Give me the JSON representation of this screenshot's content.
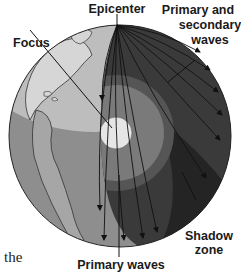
{
  "diagram": {
    "labels": {
      "epicenter": "Epicenter",
      "focus": "Focus",
      "primary_secondary_line1": "Primary and",
      "primary_secondary_line2": "secondary",
      "primary_secondary_line3": "waves",
      "shadow_line1": "Shadow",
      "shadow_line2": "zone",
      "primary_waves": "Primary waves"
    },
    "fragment_text": "the",
    "colors": {
      "ocean_light": "#c8c8c8",
      "ocean_dark": "#8e8e8e",
      "land": "#d4d4d4",
      "mantle_dark": "#3a3a3a",
      "shadow_zone": "#262626",
      "outer_core": "#7a7a7a",
      "inner_core": "#e6e6e6",
      "wave_lines": "#111111"
    }
  }
}
